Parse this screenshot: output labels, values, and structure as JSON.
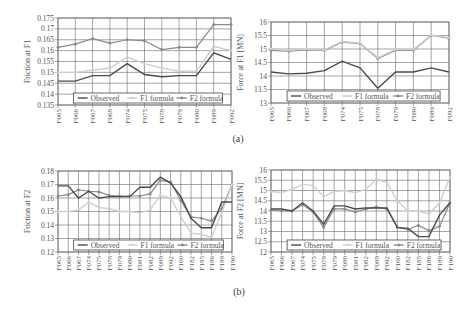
{
  "captions": {
    "a": "(a)",
    "b": "(b)"
  },
  "legend": {
    "observed": "Observed",
    "f1": "F1 formula",
    "f2": "F2 formula"
  },
  "colors": {
    "observed": "#4a4a4a",
    "f1": "#cfcfcf",
    "f2": "#8a8a8a",
    "grid": "#6a6a6a"
  },
  "chart_data": [
    {
      "id": "a-left",
      "type": "line",
      "title": "",
      "xlabel": "",
      "ylabel": "Friction at F1",
      "ylim": [
        0.135,
        0.175
      ],
      "yticks": [
        0.135,
        0.14,
        0.145,
        0.15,
        0.155,
        0.16,
        0.165,
        0.17,
        0.175
      ],
      "ytick_labels": [
        "0.135",
        "0.14",
        "0.145",
        "0.15",
        "0.155",
        "0.16",
        "0.165",
        "0.17",
        "0.175"
      ],
      "grid": true,
      "legend_position": "bottom-inside",
      "categories": [
        "F065",
        "F066",
        "F067",
        "F068",
        "F074",
        "F075",
        "F078",
        "F079",
        "F080",
        "F089",
        "F092"
      ],
      "series": [
        {
          "name": "Observed",
          "values": [
            0.146,
            0.146,
            0.1485,
            0.1485,
            0.154,
            0.149,
            0.148,
            0.1485,
            0.1485,
            0.159,
            0.156
          ]
        },
        {
          "name": "F1 formula",
          "values": [
            0.15,
            0.15,
            0.151,
            0.152,
            0.157,
            0.154,
            0.152,
            0.1505,
            0.1505,
            0.162,
            0.16
          ]
        },
        {
          "name": "F2 formula",
          "values": [
            0.1615,
            0.163,
            0.1655,
            0.1635,
            0.165,
            0.1645,
            0.1605,
            0.1615,
            0.1615,
            0.172,
            0.172
          ]
        }
      ]
    },
    {
      "id": "a-right",
      "type": "line",
      "title": "",
      "xlabel": "",
      "ylabel": "Force at F1 [MN]",
      "ylim": [
        13,
        16
      ],
      "yticks": [
        13,
        13.5,
        14,
        14.5,
        15,
        15.5,
        16
      ],
      "ytick_labels": [
        "13",
        "13.5",
        "14",
        "14.5",
        "15",
        "15.5",
        "16"
      ],
      "grid": true,
      "legend_position": "bottom-inside",
      "categories": [
        "F065",
        "F066",
        "F067",
        "F068",
        "F074",
        "F075",
        "F078",
        "F079",
        "F080",
        "F089",
        "F092"
      ],
      "series": [
        {
          "name": "Observed",
          "values": [
            14.95,
            14.92,
            14.97,
            14.95,
            15.25,
            15.2,
            14.65,
            14.95,
            14.95,
            15.5,
            15.4
          ]
        },
        {
          "name": "F1 formula",
          "values": [
            14.15,
            14.08,
            14.1,
            14.2,
            14.55,
            14.3,
            13.55,
            14.15,
            14.15,
            14.3,
            14.15
          ]
        },
        {
          "name": "F2 formula",
          "values": [
            14.95,
            14.92,
            14.97,
            14.95,
            15.25,
            15.2,
            14.65,
            14.95,
            14.95,
            15.5,
            15.4
          ]
        }
      ],
      "note_series_render": [
        {
          "name": "Observed",
          "values": [
            14.15,
            14.08,
            14.1,
            14.2,
            14.55,
            14.3,
            13.55,
            14.15,
            14.15,
            14.3,
            14.15
          ]
        },
        {
          "name": "F1 formula",
          "values": [
            15.0,
            14.95,
            15.0,
            14.97,
            15.28,
            15.22,
            14.68,
            14.98,
            14.98,
            15.52,
            15.42
          ]
        },
        {
          "name": "F2 formula",
          "values": [
            14.95,
            14.92,
            14.97,
            14.95,
            15.25,
            15.2,
            14.65,
            14.95,
            14.95,
            15.5,
            15.4
          ]
        }
      ]
    },
    {
      "id": "b-left",
      "type": "line",
      "title": "",
      "xlabel": "",
      "ylabel": "Friction at F2",
      "ylim": [
        0.12,
        0.18
      ],
      "yticks": [
        0.12,
        0.13,
        0.14,
        0.15,
        0.16,
        0.17,
        0.18
      ],
      "ytick_labels": [
        "0.12",
        "0.13",
        "0.14",
        "0.15",
        "0.16",
        "0.17",
        "0.18"
      ],
      "grid": true,
      "legend_position": "bottom-inside",
      "categories": [
        "F065",
        "F066",
        "F067",
        "F074",
        "F075",
        "F078",
        "F079",
        "F080",
        "F081",
        "F082",
        "F089",
        "F092",
        "F160",
        "F182",
        "F185",
        "F186",
        "F189",
        "F190"
      ],
      "series": [
        {
          "name": "Observed",
          "values": [
            0.169,
            0.169,
            0.16,
            0.165,
            0.16,
            0.161,
            0.161,
            0.161,
            0.168,
            0.168,
            0.1755,
            0.171,
            0.161,
            0.145,
            0.138,
            0.138,
            0.157,
            0.157
          ]
        },
        {
          "name": "F1 formula",
          "values": [
            0.15,
            0.15,
            0.151,
            0.157,
            0.153,
            0.152,
            0.15,
            0.15,
            0.149,
            0.151,
            0.162,
            0.16,
            0.146,
            0.134,
            0.133,
            0.131,
            0.149,
            0.17
          ]
        },
        {
          "name": "F2 formula",
          "values": [
            0.1615,
            0.1625,
            0.166,
            0.165,
            0.1645,
            0.162,
            0.1615,
            0.1615,
            0.1615,
            0.163,
            0.173,
            0.172,
            0.158,
            0.146,
            0.145,
            0.143,
            0.152,
            0.17
          ]
        }
      ]
    },
    {
      "id": "b-right",
      "type": "line",
      "title": "",
      "xlabel": "",
      "ylabel": "Force at F2 [MN]",
      "ylim": [
        12,
        16
      ],
      "yticks": [
        12,
        12.5,
        13,
        13.5,
        14,
        14.5,
        15,
        15.5,
        16
      ],
      "ytick_labels": [
        "12",
        "12.5",
        "13",
        "13.5",
        "14",
        "14.5",
        "15",
        "15.5",
        "16"
      ],
      "grid": true,
      "legend_position": "bottom-inside",
      "categories": [
        "F065",
        "F066",
        "F067",
        "F074",
        "F075",
        "F078",
        "F079",
        "F080",
        "F081",
        "F082",
        "F089",
        "F092",
        "F160",
        "F182",
        "F185",
        "F186",
        "F189",
        "F190"
      ],
      "series": [
        {
          "name": "Observed",
          "values": [
            14.1,
            14.1,
            14.0,
            14.4,
            14.0,
            13.35,
            14.25,
            14.25,
            14.1,
            14.15,
            14.15,
            14.15,
            13.2,
            13.15,
            12.75,
            12.75,
            13.8,
            14.4
          ]
        },
        {
          "name": "F1 formula",
          "values": [
            14.95,
            14.9,
            15.05,
            15.3,
            15.25,
            14.7,
            14.95,
            15.0,
            14.9,
            15.05,
            15.55,
            15.4,
            14.5,
            14.0,
            14.0,
            13.85,
            14.4,
            15.65
          ]
        },
        {
          "name": "F2 formula",
          "values": [
            14.05,
            14.0,
            14.0,
            14.3,
            13.95,
            13.2,
            14.1,
            14.1,
            13.95,
            14.1,
            14.2,
            14.1,
            13.2,
            13.1,
            13.3,
            13.05,
            13.25,
            14.4
          ]
        }
      ]
    }
  ]
}
